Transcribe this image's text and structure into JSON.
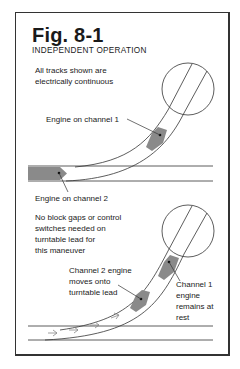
{
  "figure": {
    "title": "Fig. 8-1",
    "subtitle": "INDEPENDENT OPERATION"
  },
  "top_panel": {
    "note_line1": "All tracks shown are",
    "note_line2": "electrically continuous",
    "label_channel1": "Engine on channel 1",
    "label_channel2": "Engine on channel 2"
  },
  "bottom_panel": {
    "note_line1": "No block gaps or control",
    "note_line2": "switches needed on",
    "note_line3": "turntable lead for",
    "note_line4": "this maneuver",
    "label_ch2_line1": "Channel 2 engine",
    "label_ch2_line2": "moves onto",
    "label_ch2_line3": "turntable lead",
    "label_ch1_line1": "Channel 1",
    "label_ch1_line2": "engine",
    "label_ch1_line3": "remains at",
    "label_ch1_line4": "rest"
  },
  "colors": {
    "engine_fill": "#8a8a8a",
    "track_line": "#333333",
    "arrow": "#888888"
  }
}
